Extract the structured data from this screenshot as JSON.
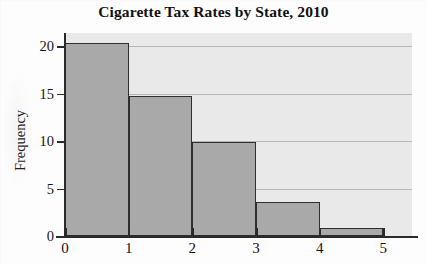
{
  "chart_data": {
    "type": "bar",
    "title": "Cigarette Tax Rates by State, 2010",
    "subtitle": "",
    "xlabel": "",
    "ylabel": "Frequency",
    "categories": [
      "0-1",
      "1-2",
      "2-3",
      "3-4",
      "4-5"
    ],
    "bin_edges": [
      0,
      1,
      2,
      3,
      4,
      5
    ],
    "values": [
      20.4,
      14.8,
      9.9,
      3.6,
      0.9
    ],
    "x_tick_labels": [
      "0",
      "1",
      "2",
      "3",
      "4",
      "5"
    ],
    "x_tick_values": [
      0,
      1,
      2,
      3,
      4,
      5
    ],
    "y_tick_labels": [
      "0",
      "5",
      "10",
      "15",
      "20"
    ],
    "y_tick_values": [
      0,
      5,
      10,
      15,
      20
    ],
    "xlim": [
      0,
      5.45
    ],
    "ylim": [
      0,
      21.4
    ],
    "grid": true,
    "grid_axis": "y",
    "legend": false,
    "legend_position": "none",
    "bar_fill_color": "#a9a9a9",
    "bar_edge_color": "#2e2e2e",
    "plot_background_color": "#e9e9e9",
    "gridline_color": "#b6b6b6",
    "axis_color": "#2a2a2a",
    "annotations": []
  }
}
